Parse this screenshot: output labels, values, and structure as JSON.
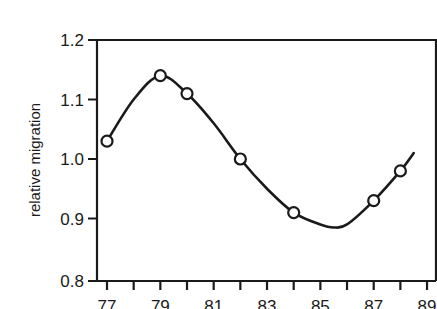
{
  "chart_data": {
    "type": "line",
    "title": "",
    "xlabel": "",
    "ylabel": "relative migration",
    "xlim": [
      77,
      89
    ],
    "ylim": [
      0.8,
      1.2
    ],
    "x_ticks_major": [
      77,
      79,
      81,
      83,
      85,
      87,
      89
    ],
    "x_tick_labels": [
      "77",
      "79",
      "81",
      "83",
      "85",
      "87",
      "89"
    ],
    "x_ticks_minor_step": 1,
    "y_ticks": [
      0.8,
      0.9,
      1.0,
      1.1,
      1.2
    ],
    "y_tick_labels": [
      "0.8",
      "0.9",
      "1.0",
      "1.1",
      "1.2"
    ],
    "grid": false,
    "legend": null,
    "series": [
      {
        "name": "observed",
        "style": "open-circle markers",
        "x": [
          77,
          79,
          80,
          82,
          84,
          87,
          88
        ],
        "y": [
          1.03,
          1.14,
          1.11,
          1.0,
          0.91,
          0.93,
          0.98
        ]
      },
      {
        "name": "fitted curve",
        "style": "smooth line",
        "x": [
          77,
          78,
          79,
          80,
          81,
          82,
          83,
          84,
          85,
          85.5,
          86,
          87,
          88,
          88.5
        ],
        "y": [
          1.03,
          1.1,
          1.14,
          1.11,
          1.06,
          1.0,
          0.95,
          0.91,
          0.89,
          0.885,
          0.89,
          0.93,
          0.98,
          1.01
        ]
      }
    ]
  },
  "colors": {
    "ink": "#1a1a1a",
    "background": "#ffffff"
  }
}
